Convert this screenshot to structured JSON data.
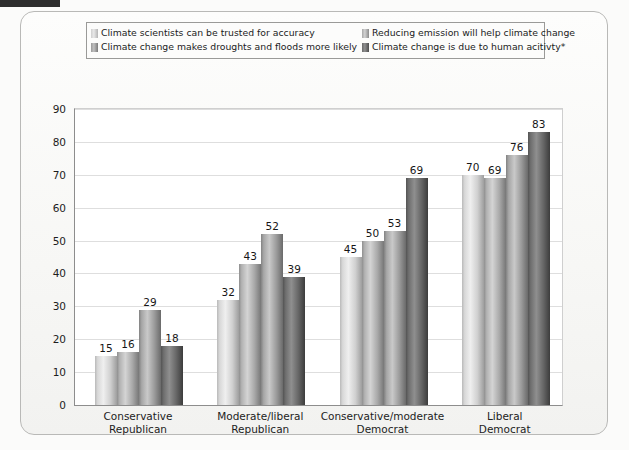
{
  "figure": {
    "legend": {
      "entries": [
        {
          "label": "Climate scientists can be trusted for accuracy",
          "swatch": "series-1-swatch"
        },
        {
          "label": "Reducing emission will help climate change",
          "swatch": "series-2-swatch"
        },
        {
          "label": "Climate change makes droughts and floods more likely",
          "swatch": "series-3-swatch"
        },
        {
          "label": "Climate change is due to human acitivty*",
          "swatch": "series-4-swatch"
        }
      ]
    }
  },
  "chart_data": {
    "type": "bar",
    "title": "",
    "xlabel": "",
    "ylabel": "",
    "ylim": [
      0,
      90
    ],
    "yticks": [
      0,
      10,
      20,
      30,
      40,
      50,
      60,
      70,
      80,
      90
    ],
    "grid": true,
    "legend_position": "top",
    "categories": [
      "Conservative\nRepublican",
      "Moderate/liberal\nRepublican",
      "Conservative/moderate\nDemocrat",
      "Liberal\nDemocrat"
    ],
    "category_lines": [
      [
        "Conservative",
        "Republican"
      ],
      [
        "Moderate/liberal",
        "Republican"
      ],
      [
        "Conservative/moderate",
        "Democrat"
      ],
      [
        "Liberal",
        "Democrat"
      ]
    ],
    "series": [
      {
        "name": "Climate scientists can be trusted for accuracy",
        "values": [
          15,
          32,
          45,
          70
        ]
      },
      {
        "name": "Reducing emission will help climate change",
        "values": [
          16,
          43,
          50,
          69
        ]
      },
      {
        "name": "Climate change makes droughts and floods more likely",
        "values": [
          29,
          52,
          53,
          76
        ]
      },
      {
        "name": "Climate change is due to human acitivty*",
        "values": [
          18,
          39,
          69,
          83
        ]
      }
    ]
  },
  "colors": {
    "series_1": "#dcdcdc",
    "series_2": "#b5b5b5",
    "series_3": "#a0a0a0",
    "series_4": "#5e5e5e",
    "gridline": "#dedede",
    "axis": "#8d8d8d",
    "frame": "#b9b9b7",
    "text": "#1d1d1d"
  }
}
